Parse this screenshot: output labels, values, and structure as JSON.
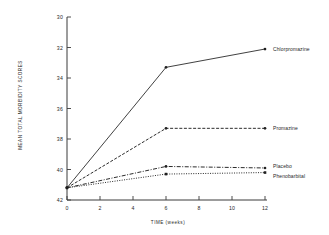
{
  "chart_data": {
    "type": "line",
    "title": "",
    "xlabel": "TIME (weeks)",
    "ylabel": "MEAN TOTAL MORBIDITY SCORES",
    "x": [
      0,
      6,
      12
    ],
    "xlim": [
      0,
      12
    ],
    "ylim": [
      30,
      42
    ],
    "y_inverted": true,
    "grid": false,
    "legend_position": "right-inline",
    "xticks": [
      "0",
      "2",
      "4",
      "6",
      "8",
      "10",
      "12"
    ],
    "xtick_values": [
      0,
      2,
      4,
      6,
      8,
      10,
      12
    ],
    "yticks": [
      "30",
      "32",
      "34",
      "36",
      "38",
      "40",
      "42"
    ],
    "ytick_values": [
      30,
      32,
      34,
      36,
      38,
      40,
      42
    ],
    "series": [
      {
        "name": "Chlorpromazine",
        "values": [
          41.2,
          33.3,
          32.1
        ],
        "linestyle": "solid",
        "marker": "dot",
        "label_y": 32.1
      },
      {
        "name": "Promazine",
        "values": [
          41.2,
          37.3,
          37.3
        ],
        "linestyle": "dashed",
        "marker": "dot",
        "label_y": 37.3
      },
      {
        "name": "Placebo",
        "values": [
          41.2,
          39.8,
          39.9
        ],
        "linestyle": "dashdot",
        "marker": "dot",
        "label_y": 39.8
      },
      {
        "name": "Phenobarbital",
        "values": [
          41.2,
          40.3,
          40.2
        ],
        "linestyle": "dotted",
        "marker": "square",
        "label_y": 40.4
      }
    ]
  },
  "labels": {
    "x_axis_title": "TIME (weeks)",
    "y_axis_title": "MEAN TOTAL MORBIDITY SCORES"
  }
}
